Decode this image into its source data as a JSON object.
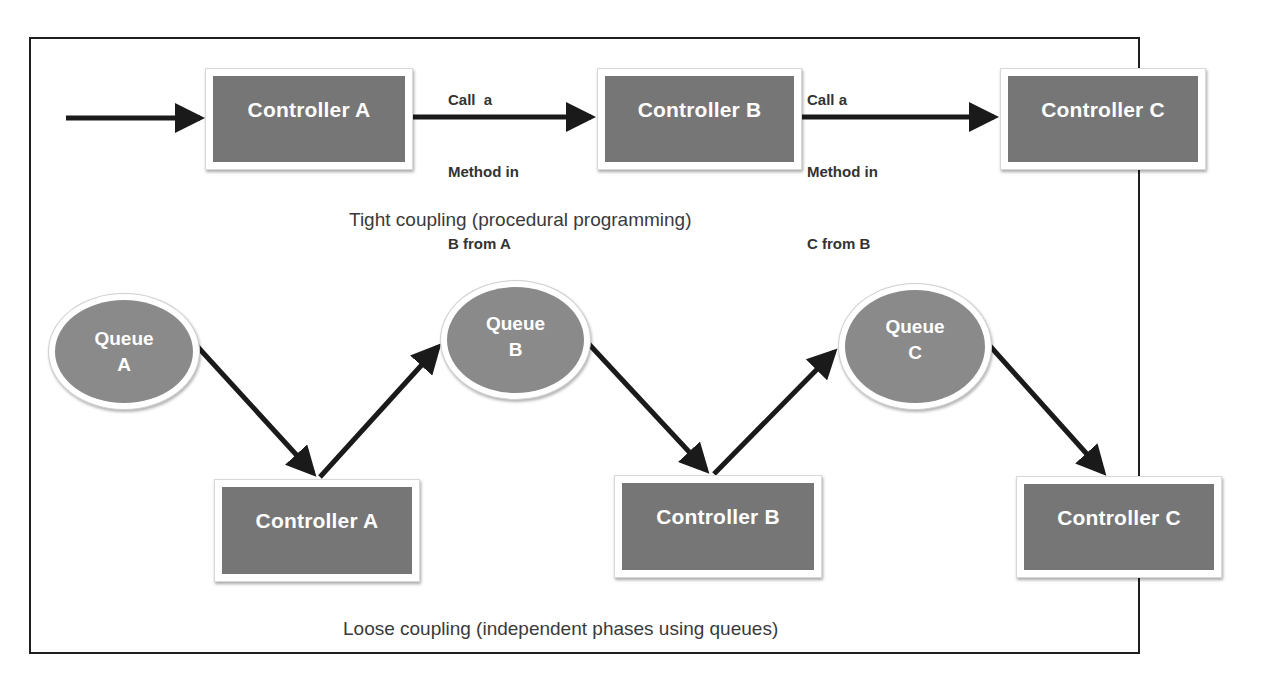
{
  "colors": {
    "frame_border": "#1f1f1f",
    "controller_fill": "#767676",
    "queue_fill": "#8a8a8a",
    "arrow": "#1a1a1a",
    "label_text": "#ffffff",
    "caption_text": "#3a3a3a"
  },
  "tight_coupling": {
    "caption": "Tight coupling (procedural programming)",
    "controllers": [
      {
        "label": "Controller A"
      },
      {
        "label": "Controller B"
      },
      {
        "label": "Controller C"
      }
    ],
    "annotations": [
      {
        "line1": "Call  a",
        "line2": "Method in",
        "line3": "B from A"
      },
      {
        "line1": "Call a",
        "line2": "Method in",
        "line3": "C from B"
      }
    ]
  },
  "loose_coupling": {
    "caption": "Loose coupling (independent phases using queues)",
    "queues": [
      {
        "line1": "Queue",
        "line2": "A"
      },
      {
        "line1": "Queue",
        "line2": "B"
      },
      {
        "line1": "Queue",
        "line2": "C"
      }
    ],
    "controllers": [
      {
        "label": "Controller A"
      },
      {
        "label": "Controller B"
      },
      {
        "label": "Controller C"
      }
    ]
  }
}
